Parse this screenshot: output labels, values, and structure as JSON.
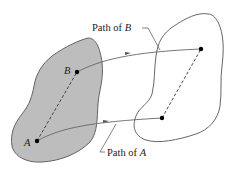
{
  "diagram": {
    "body_initial": {
      "fill": "#bdbdbd",
      "stroke": "#555555"
    },
    "body_final": {
      "fill": "#ffffff",
      "stroke": "#555555"
    },
    "points": {
      "A_initial": {
        "label": "A",
        "x": 37,
        "y": 141
      },
      "B_initial": {
        "label": "B",
        "x": 77,
        "y": 72
      },
      "A_final": {
        "x": 162,
        "y": 118
      },
      "B_final": {
        "x": 201,
        "y": 49
      }
    },
    "labels": {
      "path_b_prefix": "Path of ",
      "path_b_var": "B",
      "path_a_prefix": "Path of ",
      "path_a_var": "A",
      "point_a": "A",
      "point_b": "B"
    }
  }
}
